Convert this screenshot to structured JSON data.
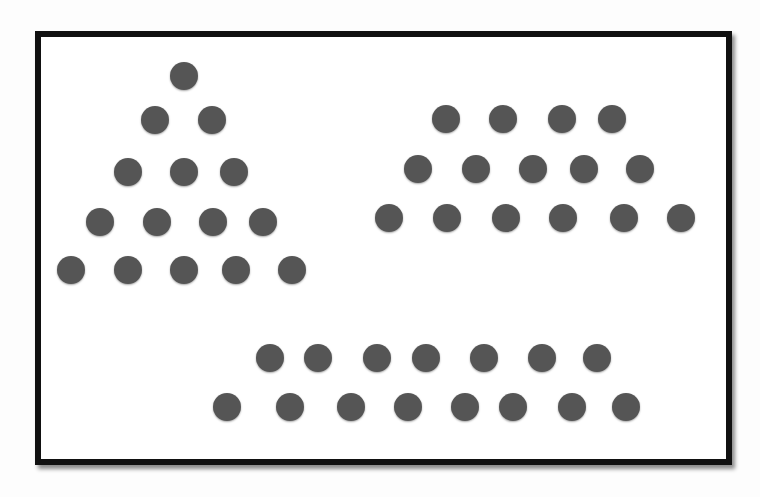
{
  "diagram": {
    "dot_color": "#555555",
    "frame_color": "#111111",
    "groups": [
      {
        "name": "triangle",
        "row_counts": [
          1,
          2,
          3,
          4,
          5
        ],
        "total": 15,
        "dots": [
          [
            184,
            76
          ],
          [
            155,
            120
          ],
          [
            212,
            120
          ],
          [
            128,
            172
          ],
          [
            184,
            172
          ],
          [
            234,
            172
          ],
          [
            100,
            222
          ],
          [
            157,
            222
          ],
          [
            213,
            222
          ],
          [
            263,
            222
          ],
          [
            71,
            270
          ],
          [
            128,
            270
          ],
          [
            184,
            270
          ],
          [
            236,
            270
          ],
          [
            292,
            270
          ]
        ]
      },
      {
        "name": "trapezoid",
        "row_counts": [
          4,
          5,
          6
        ],
        "total": 15,
        "dots": [
          [
            446,
            119
          ],
          [
            503,
            119
          ],
          [
            562,
            119
          ],
          [
            612,
            119
          ],
          [
            418,
            169
          ],
          [
            476,
            169
          ],
          [
            533,
            169
          ],
          [
            584,
            169
          ],
          [
            640,
            169
          ],
          [
            389,
            218
          ],
          [
            447,
            218
          ],
          [
            506,
            218
          ],
          [
            563,
            218
          ],
          [
            624,
            218
          ],
          [
            681,
            218
          ]
        ]
      },
      {
        "name": "two-rows",
        "row_counts": [
          7,
          8
        ],
        "total": 15,
        "dots": [
          [
            270,
            358
          ],
          [
            318,
            358
          ],
          [
            377,
            358
          ],
          [
            426,
            358
          ],
          [
            484,
            358
          ],
          [
            542,
            358
          ],
          [
            597,
            358
          ],
          [
            227,
            407
          ],
          [
            290,
            407
          ],
          [
            351,
            407
          ],
          [
            408,
            407
          ],
          [
            465,
            407
          ],
          [
            513,
            407
          ],
          [
            572,
            407
          ],
          [
            626,
            407
          ]
        ]
      }
    ]
  },
  "background_text": [
    "Frenicle... and ... up ... graphic ... arranged ... step ...",
    "one ... ical ... s ... to precede ... umbers ...",
    "... t ... was ... nown ... can be ... d to ... ",
    "... rather ... number ... shape ... ",
    "... these ... natural numbers ... in the ... ",
    "... strong ... numbers making this ... ",
    "... have ... that ... rather ... ",
    "... mathematical ... obvious ... ",
    "... needs ... and ... of ... "
  ]
}
